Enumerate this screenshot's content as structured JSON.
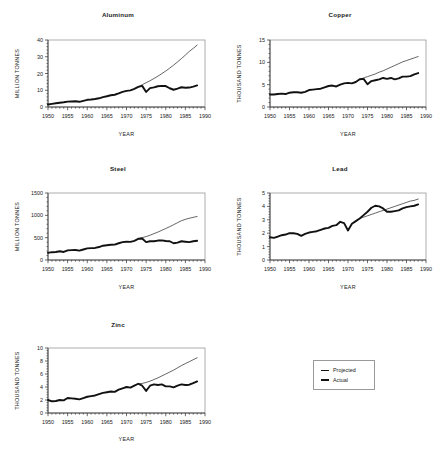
{
  "figure": {
    "legend": {
      "position": "bottom-right",
      "entries": [
        {
          "name": "projected",
          "label": "Projected",
          "style": "thin-line"
        },
        {
          "name": "actual",
          "label": "Actual",
          "style": "thick-line"
        }
      ]
    }
  },
  "chart_data": [
    {
      "type": "line",
      "title": "Aluminum",
      "xlabel": "YEAR",
      "ylabel": "MILLION TONNES",
      "xlim": [
        1950,
        1990
      ],
      "ylim": [
        0,
        40
      ],
      "xticks": [
        1950,
        1955,
        1960,
        1965,
        1970,
        1975,
        1980,
        1985,
        1990
      ],
      "yticks": [
        0,
        10,
        20,
        30,
        40
      ],
      "minor_x_interval": 1,
      "grid": false,
      "legend": "bottom-right",
      "x": [
        1950,
        1951,
        1952,
        1953,
        1954,
        1955,
        1956,
        1957,
        1958,
        1959,
        1960,
        1961,
        1962,
        1963,
        1964,
        1965,
        1966,
        1967,
        1968,
        1969,
        1970,
        1971,
        1972,
        1973,
        1974,
        1975,
        1976,
        1977,
        1978,
        1979,
        1980,
        1981,
        1982,
        1983,
        1984,
        1985,
        1986,
        1987,
        1988
      ],
      "series": [
        {
          "name": "Actual",
          "values": [
            1.5,
            1.9,
            2.2,
            2.5,
            2.8,
            3.2,
            3.3,
            3.4,
            3.1,
            3.7,
            4.3,
            4.5,
            4.8,
            5.2,
            5.9,
            6.4,
            7.0,
            7.3,
            8.1,
            9.0,
            9.6,
            9.9,
            10.8,
            12.0,
            12.6,
            9.0,
            11.3,
            11.7,
            12.4,
            12.6,
            12.5,
            11.2,
            10.3,
            11.0,
            11.8,
            11.5,
            11.6,
            12.2,
            12.9
          ]
        },
        {
          "name": "Projected",
          "values": [
            null,
            null,
            null,
            null,
            null,
            null,
            null,
            null,
            null,
            null,
            null,
            null,
            null,
            null,
            null,
            null,
            null,
            null,
            null,
            null,
            null,
            null,
            null,
            12.0,
            13.3,
            14.5,
            15.7,
            17.0,
            18.4,
            19.9,
            21.5,
            23.2,
            25.0,
            26.9,
            28.9,
            31.0,
            33.2,
            35.0,
            37.0
          ]
        }
      ]
    },
    {
      "type": "line",
      "title": "Copper",
      "xlabel": "YEAR",
      "ylabel": "THOUSAND TONNES",
      "xlim": [
        1950,
        1990
      ],
      "ylim": [
        0,
        15
      ],
      "xticks": [
        1950,
        1955,
        1960,
        1965,
        1970,
        1975,
        1980,
        1985,
        1990
      ],
      "yticks": [
        0,
        5,
        10,
        15
      ],
      "minor_x_interval": 1,
      "grid": false,
      "legend": "bottom-right",
      "x": [
        1950,
        1951,
        1952,
        1953,
        1954,
        1955,
        1956,
        1957,
        1958,
        1959,
        1960,
        1961,
        1962,
        1963,
        1964,
        1965,
        1966,
        1967,
        1968,
        1969,
        1970,
        1971,
        1972,
        1973,
        1974,
        1975,
        1976,
        1977,
        1978,
        1979,
        1980,
        1981,
        1982,
        1983,
        1984,
        1985,
        1986,
        1987,
        1988
      ],
      "series": [
        {
          "name": "Actual",
          "values": [
            2.8,
            2.8,
            2.9,
            3.0,
            2.9,
            3.2,
            3.3,
            3.3,
            3.2,
            3.4,
            3.8,
            3.9,
            4.0,
            4.1,
            4.4,
            4.7,
            4.8,
            4.6,
            5.0,
            5.3,
            5.4,
            5.3,
            5.6,
            6.2,
            6.3,
            5.1,
            5.8,
            6.0,
            6.2,
            6.5,
            6.3,
            6.5,
            6.2,
            6.4,
            6.8,
            6.8,
            6.9,
            7.3,
            7.6
          ]
        },
        {
          "name": "Projected",
          "values": [
            null,
            null,
            null,
            null,
            null,
            null,
            null,
            null,
            null,
            null,
            null,
            null,
            null,
            null,
            null,
            null,
            null,
            null,
            null,
            null,
            null,
            null,
            null,
            6.2,
            6.5,
            6.8,
            7.1,
            7.4,
            7.8,
            8.1,
            8.5,
            8.9,
            9.3,
            9.7,
            10.1,
            10.4,
            10.7,
            11.0,
            11.3
          ]
        }
      ]
    },
    {
      "type": "line",
      "title": "Steel",
      "xlabel": "YEAR",
      "ylabel": "MILLION TONNES",
      "xlim": [
        1950,
        1990
      ],
      "ylim": [
        0,
        1500
      ],
      "xticks": [
        1950,
        1955,
        1960,
        1965,
        1970,
        1975,
        1980,
        1985,
        1990
      ],
      "yticks": [
        0,
        500,
        1000,
        1500
      ],
      "minor_x_interval": 1,
      "grid": false,
      "legend": "bottom-right",
      "x": [
        1950,
        1951,
        1952,
        1953,
        1954,
        1955,
        1956,
        1957,
        1958,
        1959,
        1960,
        1961,
        1962,
        1963,
        1964,
        1965,
        1966,
        1967,
        1968,
        1969,
        1970,
        1971,
        1972,
        1973,
        1974,
        1975,
        1976,
        1977,
        1978,
        1979,
        1980,
        1981,
        1982,
        1983,
        1984,
        1985,
        1986,
        1987,
        1988
      ],
      "series": [
        {
          "name": "Actual",
          "values": [
            160,
            175,
            180,
            195,
            180,
            215,
            220,
            225,
            210,
            235,
            260,
            265,
            270,
            290,
            320,
            330,
            340,
            345,
            375,
            400,
            410,
            405,
            430,
            475,
            480,
            400,
            420,
            420,
            435,
            440,
            425,
            420,
            375,
            390,
            420,
            410,
            400,
            420,
            430
          ]
        },
        {
          "name": "Projected",
          "values": [
            null,
            null,
            null,
            null,
            null,
            null,
            null,
            null,
            null,
            null,
            null,
            null,
            null,
            null,
            null,
            null,
            null,
            null,
            null,
            null,
            null,
            null,
            null,
            475,
            500,
            525,
            555,
            590,
            625,
            665,
            705,
            745,
            790,
            835,
            880,
            910,
            935,
            955,
            975
          ]
        }
      ]
    },
    {
      "type": "line",
      "title": "Lead",
      "xlabel": "YEAR",
      "ylabel": "THOUSAND TONNES",
      "xlim": [
        1950,
        1990
      ],
      "ylim": [
        0,
        5
      ],
      "xticks": [
        1950,
        1955,
        1960,
        1965,
        1970,
        1975,
        1980,
        1985,
        1990
      ],
      "yticks": [
        0,
        1,
        2,
        3,
        4,
        5
      ],
      "minor_x_interval": 1,
      "grid": false,
      "legend": "bottom-right",
      "x": [
        1950,
        1951,
        1952,
        1953,
        1954,
        1955,
        1956,
        1957,
        1958,
        1959,
        1960,
        1961,
        1962,
        1963,
        1964,
        1965,
        1966,
        1967,
        1968,
        1969,
        1970,
        1971,
        1972,
        1973,
        1974,
        1975,
        1976,
        1977,
        1978,
        1979,
        1980,
        1981,
        1982,
        1983,
        1984,
        1985,
        1986,
        1987,
        1988
      ],
      "series": [
        {
          "name": "Actual",
          "values": [
            1.7,
            1.65,
            1.75,
            1.85,
            1.9,
            2.0,
            2.0,
            1.95,
            1.8,
            1.95,
            2.05,
            2.1,
            2.15,
            2.25,
            2.35,
            2.4,
            2.55,
            2.6,
            2.85,
            2.75,
            2.2,
            2.7,
            2.9,
            3.1,
            3.35,
            3.6,
            3.9,
            4.05,
            4.0,
            3.85,
            3.6,
            3.6,
            3.65,
            3.7,
            3.85,
            3.95,
            4.0,
            4.05,
            4.15
          ]
        },
        {
          "name": "Projected",
          "values": [
            null,
            null,
            null,
            null,
            null,
            null,
            null,
            null,
            null,
            null,
            null,
            null,
            null,
            null,
            null,
            null,
            null,
            null,
            null,
            null,
            null,
            null,
            null,
            3.1,
            3.2,
            3.3,
            3.4,
            3.5,
            3.6,
            3.7,
            3.8,
            3.9,
            4.0,
            4.1,
            4.2,
            4.3,
            4.4,
            4.45,
            4.55
          ]
        }
      ]
    },
    {
      "type": "line",
      "title": "Zinc",
      "xlabel": "YEAR",
      "ylabel": "THOUSAND TONNES",
      "xlim": [
        1950,
        1990
      ],
      "ylim": [
        0,
        10
      ],
      "xticks": [
        1950,
        1955,
        1960,
        1965,
        1970,
        1975,
        1980,
        1985,
        1990
      ],
      "yticks": [
        0,
        2,
        4,
        6,
        8,
        10
      ],
      "minor_x_interval": 1,
      "grid": false,
      "legend": "bottom-right",
      "x": [
        1950,
        1951,
        1952,
        1953,
        1954,
        1955,
        1956,
        1957,
        1958,
        1959,
        1960,
        1961,
        1962,
        1963,
        1964,
        1965,
        1966,
        1967,
        1968,
        1969,
        1970,
        1971,
        1972,
        1973,
        1974,
        1975,
        1976,
        1977,
        1978,
        1979,
        1980,
        1981,
        1982,
        1983,
        1984,
        1985,
        1986,
        1987,
        1988
      ],
      "series": [
        {
          "name": "Actual",
          "values": [
            2.0,
            1.8,
            1.85,
            2.0,
            1.95,
            2.3,
            2.25,
            2.2,
            2.1,
            2.3,
            2.5,
            2.6,
            2.7,
            2.9,
            3.1,
            3.2,
            3.3,
            3.25,
            3.6,
            3.8,
            4.0,
            3.9,
            4.2,
            4.5,
            4.2,
            3.4,
            4.2,
            4.4,
            4.3,
            4.4,
            4.1,
            4.1,
            3.95,
            4.2,
            4.4,
            4.3,
            4.35,
            4.6,
            4.85
          ]
        },
        {
          "name": "Projected",
          "values": [
            null,
            null,
            null,
            null,
            null,
            null,
            null,
            null,
            null,
            null,
            null,
            null,
            null,
            null,
            null,
            null,
            null,
            null,
            null,
            null,
            null,
            null,
            null,
            4.5,
            4.55,
            4.7,
            4.9,
            5.15,
            5.4,
            5.7,
            6.0,
            6.3,
            6.6,
            6.95,
            7.3,
            7.6,
            7.9,
            8.2,
            8.5
          ]
        }
      ]
    }
  ]
}
